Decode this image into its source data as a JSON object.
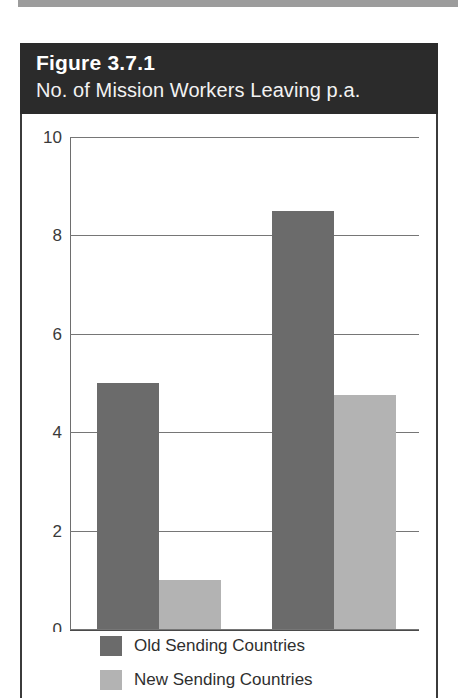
{
  "page": {
    "top_rule_color": "#9c9c9c",
    "background_color": "#ffffff"
  },
  "figure": {
    "number": "Figure 3.7.1",
    "caption": "No. of Mission Workers Leaving p.a.",
    "banner_background": "#2b2b2b",
    "banner_text_color": "#ffffff"
  },
  "chart_data": {
    "type": "bar",
    "title": "No. of Mission Workers Leaving p.a.",
    "subtitle": "Figure 3.7.1",
    "categories": [
      "High retention",
      "Low retention"
    ],
    "series": [
      {
        "name": "Old Sending Countries",
        "color": "#6b6b6b",
        "values": [
          5.0,
          8.5
        ]
      },
      {
        "name": "New Sending Countries",
        "color": "#b3b3b3",
        "values": [
          1.0,
          4.75
        ]
      }
    ],
    "xlabel": "",
    "ylabel": "",
    "ylim": [
      0,
      10
    ],
    "yticks": [
      0,
      2,
      4,
      6,
      8,
      10
    ],
    "ytick_labels": [
      "0",
      "2",
      "4",
      "6",
      "8",
      "10"
    ],
    "grid": true,
    "grid_axis": "y",
    "legend_position": "bottom-left"
  }
}
